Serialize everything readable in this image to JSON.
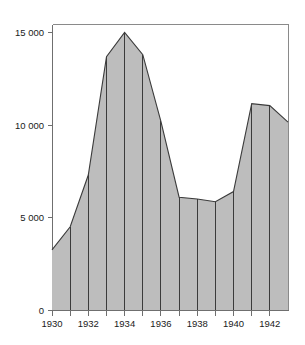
{
  "chart_data": {
    "type": "area",
    "title": "",
    "subtitle": "",
    "xlabel": "",
    "ylabel": "",
    "x": [
      1930,
      1931,
      1932,
      1933,
      1934,
      1935,
      1936,
      1937,
      1938,
      1939,
      1940,
      1941,
      1942,
      1943
    ],
    "values": [
      3250,
      4500,
      7300,
      13700,
      15000,
      13800,
      10200,
      6100,
      6000,
      5850,
      6400,
      11150,
      11050,
      10150
    ],
    "series": [
      {
        "name": "series-1",
        "values": [
          3250,
          4500,
          7300,
          13700,
          15000,
          13800,
          10200,
          6100,
          6000,
          5850,
          6400,
          11150,
          11050,
          10150
        ]
      }
    ],
    "xlim": [
      1930,
      1943
    ],
    "ylim": [
      0,
      15800
    ],
    "yticks": [
      0,
      5000,
      10000,
      15000
    ],
    "ytick_labels": [
      "0",
      "5 000",
      "10 000",
      "15 000"
    ],
    "xticks": [
      1930,
      1931,
      1932,
      1933,
      1934,
      1935,
      1936,
      1937,
      1938,
      1939,
      1940,
      1941,
      1942
    ],
    "xtick_labels_major": [
      "1930",
      "1932",
      "1934",
      "1936",
      "1938",
      "1940",
      "1942"
    ],
    "xticks_major": [
      1930,
      1932,
      1934,
      1936,
      1938,
      1940,
      1942
    ],
    "grid": false,
    "legend": null,
    "legend_position": "none",
    "fill_color": "#bdbdbd",
    "line_color": "#3b3b3b",
    "axis_color": "#6f6f6f",
    "frame_color": "#8a8a8a",
    "background_color": "#ffffff",
    "vertical_rules_at": [
      1931,
      1932,
      1933,
      1934,
      1935,
      1936,
      1937,
      1938,
      1939,
      1940,
      1941,
      1942
    ],
    "annotations": []
  }
}
